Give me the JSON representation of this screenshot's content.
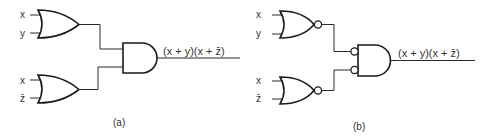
{
  "figure": {
    "panels": [
      {
        "caption": "(a)",
        "type": "OR-AND",
        "gate1": {
          "kind": "OR",
          "inputs": [
            "x",
            "y"
          ]
        },
        "gate2": {
          "kind": "OR",
          "inputs": [
            "x",
            "z̄"
          ]
        },
        "output_gate": {
          "kind": "AND",
          "inverted_inputs": false
        },
        "output_label": "(x + y)(x + z̄)"
      },
      {
        "caption": "(b)",
        "type": "NOR-NOR (AND with inverted inputs)",
        "gate1": {
          "kind": "NOR",
          "inputs": [
            "x",
            "y"
          ]
        },
        "gate2": {
          "kind": "NOR",
          "inputs": [
            "x",
            "z̄"
          ]
        },
        "output_gate": {
          "kind": "AND",
          "inverted_inputs": true
        },
        "output_label": "(x + y)(x + z̄)"
      }
    ]
  },
  "colors": {
    "line": "#1a1a1a",
    "text": "#333333",
    "background": "#ffffff"
  }
}
